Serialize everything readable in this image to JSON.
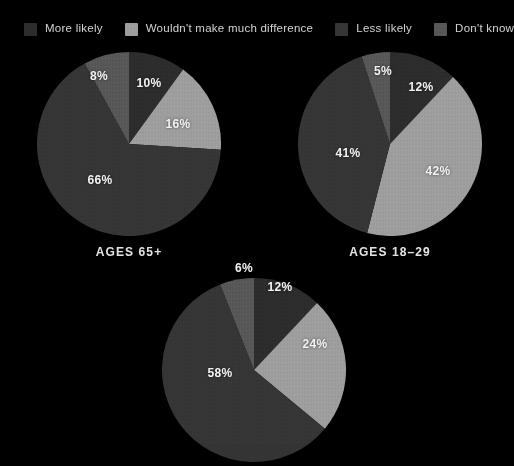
{
  "background_color": "#000000",
  "legend": {
    "items": [
      {
        "label": "More likely",
        "color": "#2b2b2b"
      },
      {
        "label": "Wouldn't make much difference",
        "color": "#9b9b9b"
      },
      {
        "label": "Less likely",
        "color": "#343434"
      },
      {
        "label": "Don't know",
        "color": "#555555"
      }
    ]
  },
  "chart_data": [
    {
      "type": "pie",
      "title": "AGES 65+",
      "categories": [
        "More likely",
        "Wouldn't make much difference",
        "Less likely",
        "Don't know"
      ],
      "values": [
        10,
        16,
        66,
        8
      ],
      "labels": [
        "10%",
        "16%",
        "66%",
        "8%"
      ],
      "colors": [
        "#2b2b2b",
        "#9b9b9b",
        "#343434",
        "#555555"
      ],
      "start_angle": 0,
      "legend_position": "top"
    },
    {
      "type": "pie",
      "title": "AGES 18–29",
      "categories": [
        "More likely",
        "Wouldn't make much difference",
        "Less likely",
        "Don't know"
      ],
      "values": [
        12,
        42,
        41,
        5
      ],
      "labels": [
        "12%",
        "42%",
        "41%",
        "5%"
      ],
      "colors": [
        "#2b2b2b",
        "#9b9b9b",
        "#343434",
        "#555555"
      ],
      "start_angle": 0,
      "legend_position": "top"
    },
    {
      "type": "pie",
      "title": "",
      "categories": [
        "More likely",
        "Wouldn't make much difference",
        "Less likely",
        "Don't know"
      ],
      "values": [
        12,
        24,
        58,
        6
      ],
      "labels": [
        "12%",
        "24%",
        "58%",
        "6%"
      ],
      "colors": [
        "#2b2b2b",
        "#9b9b9b",
        "#343434",
        "#555555"
      ],
      "start_angle": 0,
      "legend_position": "top"
    }
  ],
  "charts": [
    {
      "name": "ages-65-plus",
      "caption": "AGES 65+",
      "cx": 129,
      "cy": 144,
      "r": 92,
      "caption_x": 9,
      "caption_y": 245,
      "slices": [
        {
          "label": "10%",
          "pct": 10,
          "color": "#2b2b2b",
          "lx": 149,
          "ly": 83,
          "outside": false
        },
        {
          "label": "16%",
          "pct": 16,
          "color": "#9b9b9b",
          "lx": 178,
          "ly": 124,
          "outside": false
        },
        {
          "label": "66%",
          "pct": 66,
          "color": "#343434",
          "lx": 100,
          "ly": 180,
          "outside": false
        },
        {
          "label": "8%",
          "pct": 8,
          "color": "#555555",
          "lx": 99,
          "ly": 76,
          "outside": false
        }
      ]
    },
    {
      "name": "ages-18-29",
      "caption": "AGES 18–29",
      "cx": 390,
      "cy": 144,
      "r": 92,
      "caption_x": 270,
      "caption_y": 245,
      "slices": [
        {
          "label": "12%",
          "pct": 12,
          "color": "#2b2b2b",
          "lx": 421,
          "ly": 87,
          "outside": false
        },
        {
          "label": "42%",
          "pct": 42,
          "color": "#9b9b9b",
          "lx": 438,
          "ly": 171,
          "outside": false
        },
        {
          "label": "41%",
          "pct": 41,
          "color": "#343434",
          "lx": 348,
          "ly": 153,
          "outside": false
        },
        {
          "label": "5%",
          "pct": 5,
          "color": "#555555",
          "lx": 383,
          "ly": 71,
          "outside": false
        }
      ]
    },
    {
      "name": "unlabeled-age-group",
      "caption": "",
      "cx": 254,
      "cy": 370,
      "r": 92,
      "caption_x": 134,
      "caption_y": 470,
      "slices": [
        {
          "label": "12%",
          "pct": 12,
          "color": "#2b2b2b",
          "lx": 280,
          "ly": 287,
          "outside": false
        },
        {
          "label": "24%",
          "pct": 24,
          "color": "#9b9b9b",
          "lx": 315,
          "ly": 344,
          "outside": false
        },
        {
          "label": "58%",
          "pct": 58,
          "color": "#343434",
          "lx": 220,
          "ly": 373,
          "outside": false
        },
        {
          "label": "6%",
          "pct": 6,
          "color": "#555555",
          "lx": 244,
          "ly": 268,
          "outside": false
        }
      ]
    }
  ]
}
